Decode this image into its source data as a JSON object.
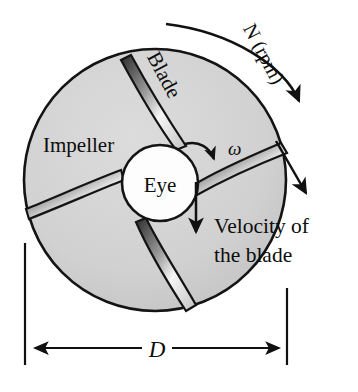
{
  "figure": {
    "background_color": "#ffffff",
    "disc_fill": "#d2d2d2",
    "eye_fill": "#fdfdfd",
    "line_color": "#1a1a1a",
    "blade_highlight": "#f2f2f2"
  },
  "labels": {
    "impeller": "Impeller",
    "blade": "Blade",
    "eye": "Eye",
    "omega": "ω",
    "speed": "N (rpm)",
    "velocity_line1": "Velocity of",
    "velocity_line2": "the blade",
    "diameter": "D"
  },
  "geometry": {
    "disc_center_x": 155,
    "disc_center_y": 180,
    "disc_radius": 131,
    "eye_center_x": 160,
    "eye_center_y": 183,
    "eye_radius": 38,
    "blade_count": 4,
    "dimension_left_x": 25,
    "dimension_right_x": 287,
    "dimension_y": 348
  },
  "annotations": {
    "rotation_direction": "clockwise",
    "blade_type": "backward-curved",
    "velocity_arrow": "tangential at blade tip",
    "eye_velocity_arrow": "downward from eye"
  }
}
